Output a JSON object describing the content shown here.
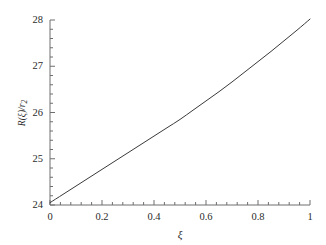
{
  "chart_data": {
    "type": "line",
    "title": "",
    "subtitle": "",
    "xlabel": "ξ",
    "ylabel": "R(ξ)/r",
    "ylabel_subscript": "2",
    "xlim": [
      0,
      1
    ],
    "ylim": [
      24,
      28
    ],
    "grid": false,
    "legend": null,
    "xticks": [
      0,
      0.2,
      0.4,
      0.6,
      0.8,
      1
    ],
    "xtick_labels": [
      "0",
      "0.2",
      "0.4",
      "0.6",
      "0.8",
      "1"
    ],
    "yticks": [
      24,
      25,
      26,
      27,
      28
    ],
    "ytick_labels": [
      "24",
      "25",
      "26",
      "27",
      "28"
    ],
    "minor_ticks_per_interval": 4,
    "line_color": "#3a3a3a",
    "line_width": 1.0,
    "series": [
      {
        "name": "R(ξ)/r2",
        "x": [
          0.0,
          0.05,
          0.1,
          0.15,
          0.2,
          0.25,
          0.3,
          0.35,
          0.4,
          0.45,
          0.5,
          0.55,
          0.6,
          0.65,
          0.7,
          0.75,
          0.8,
          0.85,
          0.9,
          0.95,
          1.0
        ],
        "values": [
          24.05,
          24.23,
          24.41,
          24.59,
          24.77,
          24.95,
          25.13,
          25.31,
          25.49,
          25.67,
          25.85,
          26.05,
          26.25,
          26.45,
          26.66,
          26.88,
          27.1,
          27.32,
          27.55,
          27.78,
          28.02
        ]
      }
    ]
  },
  "axes_geometry": {
    "left_px": 50,
    "right_px": 310,
    "top_px": 20,
    "bottom_px": 205
  }
}
